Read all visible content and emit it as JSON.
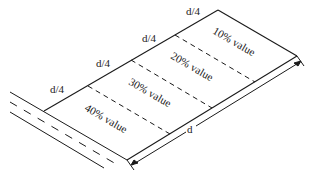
{
  "diagram": {
    "segment_labels": [
      "d/4",
      "d/4",
      "d/4",
      "d/4"
    ],
    "zone_labels": [
      "10% value",
      "20% value",
      "30% value",
      "40% value"
    ],
    "dimension_label": "d",
    "colors": {
      "line": "#1a1a1a",
      "background": "#ffffff"
    }
  }
}
